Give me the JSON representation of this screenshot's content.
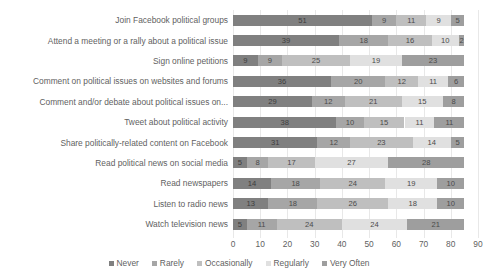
{
  "title": {
    "text": "",
    "visible_fragment": true
  },
  "axis": {
    "ticks": [
      "0",
      "10",
      "20",
      "30",
      "40",
      "50",
      "60",
      "70",
      "80",
      "90"
    ],
    "xlabel": "",
    "ylabel": ""
  },
  "legend": {
    "position": "bottom-center",
    "items": [
      {
        "label": "Never",
        "color": "#808080"
      },
      {
        "label": "Rarely",
        "color": "#a6a6a6"
      },
      {
        "label": "Occasionally",
        "color": "#bfbfbf"
      },
      {
        "label": "Regularly",
        "color": "#e0e0e0"
      },
      {
        "label": "Very Often",
        "color": "#9e9e9e"
      }
    ]
  },
  "chart_data": {
    "type": "bar",
    "orientation": "horizontal",
    "stacked": true,
    "title": "",
    "xlabel": "",
    "ylabel": "",
    "xlim": [
      0,
      90
    ],
    "xticks": [
      0,
      10,
      20,
      30,
      40,
      50,
      60,
      70,
      80,
      90
    ],
    "grid": true,
    "legend_position": "bottom",
    "categories": [
      "Join Facebook political groups",
      "Attend a meeting or a rally about a political issue",
      "Sign online petitions",
      "Comment on political issues on websites and forums",
      "Comment and/or debate about political issues on...",
      "Tweet about political activity",
      "Share politically-related content on Facebook",
      "Read political news on social media",
      "Read newspapers",
      "Listen to radio news",
      "Watch television news"
    ],
    "series": [
      {
        "name": "Never",
        "color": "#808080",
        "values": [
          51,
          39,
          9,
          36,
          29,
          38,
          31,
          5,
          14,
          13,
          5
        ]
      },
      {
        "name": "Rarely",
        "color": "#a6a6a6",
        "values": [
          9,
          18,
          9,
          20,
          12,
          10,
          12,
          8,
          18,
          18,
          11
        ]
      },
      {
        "name": "Occasionally",
        "color": "#bfbfbf",
        "values": [
          11,
          16,
          25,
          12,
          21,
          15,
          23,
          17,
          24,
          26,
          24
        ]
      },
      {
        "name": "Regularly",
        "color": "#e0e0e0",
        "values": [
          9,
          10,
          19,
          11,
          15,
          11,
          14,
          27,
          19,
          18,
          24
        ]
      },
      {
        "name": "Very Often",
        "color": "#9e9e9e",
        "values": [
          5,
          2,
          23,
          6,
          8,
          11,
          5,
          28,
          10,
          10,
          21
        ]
      }
    ]
  }
}
